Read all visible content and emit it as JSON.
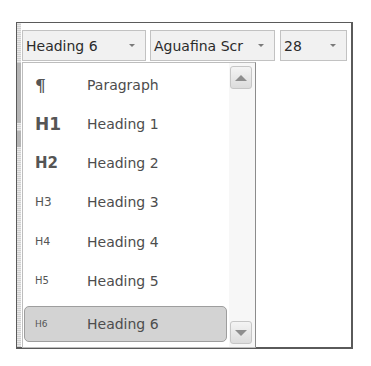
{
  "toolbar": {
    "style_combo": {
      "value": "Heading 6"
    },
    "font_combo": {
      "value": "Aguafina Scr"
    },
    "size_combo": {
      "value": "28"
    }
  },
  "dropdown": {
    "items": [
      {
        "glyph": "¶",
        "label": "Paragraph",
        "selected": false
      },
      {
        "glyph": "H1",
        "label": "Heading 1",
        "selected": false
      },
      {
        "glyph": "H2",
        "label": "Heading 2",
        "selected": false
      },
      {
        "glyph": "H3",
        "label": "Heading 3",
        "selected": false
      },
      {
        "glyph": "H4",
        "label": "Heading 4",
        "selected": false
      },
      {
        "glyph": "H5",
        "label": "Heading 5",
        "selected": false
      },
      {
        "glyph": "H6",
        "label": "Heading 6",
        "selected": true
      }
    ],
    "scrollbar": {
      "up_icon": "triangle-up",
      "down_icon": "triangle-down"
    }
  },
  "colors": {
    "frame_border": "#5a5a5a",
    "combo_bg": "#f1f1f1",
    "selected_bg": "#d3d3d3",
    "text": "#4d4d4d"
  }
}
